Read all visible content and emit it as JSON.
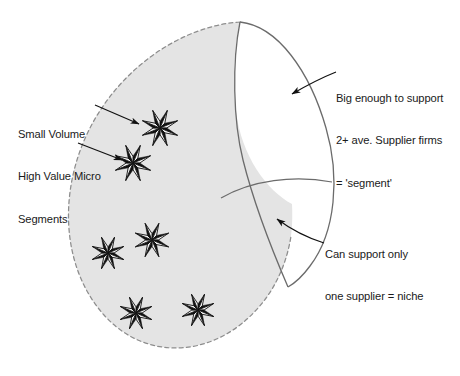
{
  "diagram": {
    "type": "market-segmentation-venn",
    "background_color": "#ffffff",
    "shape_fill_color": "#e4e4e4",
    "outline_color": "#6b6b6b",
    "text_color": "#1a1a1a",
    "annotations": {
      "segment": {
        "lines": [
          "Big enough to support",
          "2+ ave. Supplier firms",
          "= 'segment'"
        ],
        "arrow_from": [
          336,
          72
        ],
        "arrow_to": [
          292,
          94
        ]
      },
      "niche": {
        "lines": [
          "Can support only",
          "one supplier = niche"
        ],
        "arrow_from": [
          324,
          243
        ],
        "arrow_to": [
          277,
          219
        ]
      },
      "micro_segments": {
        "lines": [
          "Small Volume",
          "High Value Micro",
          "Segments"
        ],
        "arrows": [
          {
            "from": [
              95,
              105
            ],
            "to": [
              139,
              124
            ]
          },
          {
            "from": [
              78,
              143
            ],
            "to": [
              122,
              160
            ]
          }
        ]
      }
    },
    "stars": [
      {
        "name": "star-1",
        "cx": 160,
        "cy": 128,
        "r": 19
      },
      {
        "name": "star-2",
        "cx": 133,
        "cy": 163,
        "r": 19
      },
      {
        "name": "star-3",
        "cx": 108,
        "cy": 253,
        "r": 17
      },
      {
        "name": "star-4",
        "cx": 152,
        "cy": 240,
        "r": 18
      },
      {
        "name": "star-5",
        "cx": 136,
        "cy": 313,
        "r": 17
      },
      {
        "name": "star-6",
        "cx": 198,
        "cy": 310,
        "r": 17
      }
    ],
    "star_points": 8
  }
}
